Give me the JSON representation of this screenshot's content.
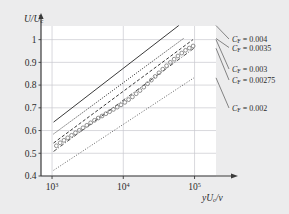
{
  "figure": {
    "background_color": "#ececed",
    "plot_background_color": "#ffffff",
    "grid_color": "#c9c9cf",
    "axis_color": "#3a3a3a",
    "line_color": "#3a3a3a",
    "marker_color": "#6e6e6e"
  },
  "axes": {
    "y": {
      "title_main": "U/U",
      "title_sub": "c",
      "ticks": [
        "1",
        "0.9",
        "0.8",
        "0.7",
        "0.6",
        "0.5",
        "0.4"
      ],
      "tick_values": [
        1,
        0.9,
        0.8,
        0.7,
        0.6,
        0.5,
        0.4
      ],
      "min": 0.4,
      "max": 1.06
    },
    "x": {
      "title_main": "yU",
      "title_sub": "c",
      "title_tail": "/ν",
      "ticks": [
        {
          "mantissa": "10",
          "exponent": "3",
          "value": 1000
        },
        {
          "mantissa": "10",
          "exponent": "4",
          "value": 10000
        },
        {
          "mantissa": "10",
          "exponent": "5",
          "value": 100000
        }
      ],
      "min": 700,
      "max": 200000
    }
  },
  "legend": {
    "items": [
      {
        "symbol": "C",
        "symbol_sub": "F",
        "equals": " = ",
        "value": "0.004",
        "style": "solid"
      },
      {
        "symbol": "C",
        "symbol_sub": "F",
        "equals": " = ",
        "value": "0.0035",
        "style": "dotted"
      },
      {
        "symbol": "C",
        "symbol_sub": "F",
        "equals": " = ",
        "value": "0.003",
        "style": "dashed"
      },
      {
        "symbol": "C",
        "symbol_sub": "F",
        "equals": " = ",
        "value": "0.00275",
        "style": "dashdot"
      },
      {
        "symbol": "C",
        "symbol_sub": "F",
        "equals": " = ",
        "value": "0.002",
        "style": "dotted-fine"
      }
    ]
  },
  "chart_data": {
    "type": "line",
    "title": "",
    "xlabel": "yU_c/ν",
    "ylabel": "U/U_c",
    "xscale": "log",
    "yscale": "linear",
    "xlim": [
      700,
      200000
    ],
    "ylim": [
      0.4,
      1.06
    ],
    "grid": true,
    "legend_position": "right-inline-with-leader-lines",
    "series": [
      {
        "name": "C_F = 0.004",
        "style": "solid",
        "x": [
          1050,
          60000
        ],
        "y": [
          0.637,
          1.062
        ]
      },
      {
        "name": "C_F = 0.0035",
        "style": "dotted",
        "x": [
          1050,
          70000
        ],
        "y": [
          0.585,
          1.005
        ]
      },
      {
        "name": "C_F = 0.003",
        "style": "dashed",
        "x": [
          1050,
          95000
        ],
        "y": [
          0.545,
          1.0
        ]
      },
      {
        "name": "C_F = 0.00275",
        "style": "dashdot",
        "x": [
          1050,
          98000
        ],
        "y": [
          0.508,
          0.962
        ]
      },
      {
        "name": "C_F = 0.002",
        "style": "dotted-fine",
        "x": [
          1050,
          98000
        ],
        "y": [
          0.425,
          0.832
        ]
      },
      {
        "name": "measured data",
        "style": "open-circles",
        "marker": "o",
        "x": [
          1150,
          1300,
          1470,
          1660,
          1880,
          2130,
          2410,
          2720,
          3080,
          3480,
          3940,
          4450,
          5030,
          5690,
          6430,
          7270,
          8220,
          9290,
          10500,
          11870,
          13420,
          15170,
          17150,
          19390,
          21920,
          24780,
          28010,
          31670,
          35800,
          40470,
          45750,
          51720,
          58470,
          66100,
          74720,
          84470,
          95500
        ],
        "y": [
          0.533,
          0.546,
          0.557,
          0.568,
          0.579,
          0.59,
          0.601,
          0.612,
          0.623,
          0.634,
          0.645,
          0.655,
          0.664,
          0.674,
          0.683,
          0.693,
          0.703,
          0.713,
          0.724,
          0.736,
          0.748,
          0.762,
          0.776,
          0.791,
          0.806,
          0.822,
          0.838,
          0.854,
          0.87,
          0.885,
          0.9,
          0.914,
          0.928,
          0.941,
          0.953,
          0.963,
          0.972
        ]
      }
    ]
  }
}
